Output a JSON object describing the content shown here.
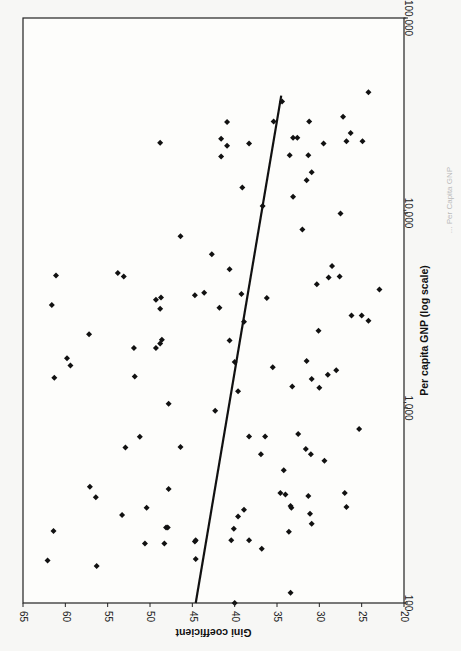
{
  "chart_data": {
    "type": "scatter",
    "orientation": "rotated-90-clockwise",
    "title": "",
    "xlabel": "Per capita GNP  (log scale)",
    "ylabel": "Gini coefficient",
    "x_scale": "log",
    "xlim": [
      100,
      100000
    ],
    "ylim": [
      20,
      65
    ],
    "x_ticks": [
      "100",
      "1,000",
      "10,000",
      "100,000"
    ],
    "y_ticks": [
      "65",
      "60",
      "55",
      "50",
      "45",
      "40",
      "35",
      "30",
      "25",
      "20"
    ],
    "grid": false,
    "legend": null,
    "trendline": {
      "x": [
        100,
        40000
      ],
      "y": [
        44.6,
        34.5
      ]
    },
    "caption": "... Per Capita GNP",
    "points": [
      {
        "x": 100,
        "y": 40.0
      },
      {
        "x": 113,
        "y": 33.4
      },
      {
        "x": 155,
        "y": 56.3
      },
      {
        "x": 165,
        "y": 62.1
      },
      {
        "x": 168,
        "y": 44.6
      },
      {
        "x": 202,
        "y": 50.6
      },
      {
        "x": 202,
        "y": 48.3
      },
      {
        "x": 207,
        "y": 44.7
      },
      {
        "x": 210,
        "y": 44.6
      },
      {
        "x": 210,
        "y": 40.4
      },
      {
        "x": 210,
        "y": 38.3
      },
      {
        "x": 190,
        "y": 36.8
      },
      {
        "x": 234,
        "y": 61.4
      },
      {
        "x": 232,
        "y": 33.6
      },
      {
        "x": 244,
        "y": 48.1
      },
      {
        "x": 244,
        "y": 47.9
      },
      {
        "x": 240,
        "y": 40.1
      },
      {
        "x": 255,
        "y": 30.9
      },
      {
        "x": 283,
        "y": 53.3
      },
      {
        "x": 287,
        "y": 31.1
      },
      {
        "x": 278,
        "y": 39.6
      },
      {
        "x": 308,
        "y": 50.4
      },
      {
        "x": 301,
        "y": 38.9
      },
      {
        "x": 308,
        "y": 33.3
      },
      {
        "x": 314,
        "y": 33.4
      },
      {
        "x": 311,
        "y": 26.8
      },
      {
        "x": 349,
        "y": 56.4
      },
      {
        "x": 360,
        "y": 34.0
      },
      {
        "x": 367,
        "y": 34.6
      },
      {
        "x": 354,
        "y": 31.3
      },
      {
        "x": 395,
        "y": 57.1
      },
      {
        "x": 384,
        "y": 47.8
      },
      {
        "x": 366,
        "y": 27.0
      },
      {
        "x": 480,
        "y": 34.2
      },
      {
        "x": 537,
        "y": 29.4
      },
      {
        "x": 579,
        "y": 36.9
      },
      {
        "x": 579,
        "y": 31.0
      },
      {
        "x": 617,
        "y": 31.6
      },
      {
        "x": 628,
        "y": 52.9
      },
      {
        "x": 631,
        "y": 46.4
      },
      {
        "x": 712,
        "y": 51.2
      },
      {
        "x": 714,
        "y": 38.3
      },
      {
        "x": 714,
        "y": 36.4
      },
      {
        "x": 735,
        "y": 32.5
      },
      {
        "x": 781,
        "y": 25.3
      },
      {
        "x": 969,
        "y": 42.3
      },
      {
        "x": 1052,
        "y": 47.8
      },
      {
        "x": 1220,
        "y": 39.6
      },
      {
        "x": 1290,
        "y": 33.2
      },
      {
        "x": 1270,
        "y": 30.0
      },
      {
        "x": 1430,
        "y": 61.3
      },
      {
        "x": 1450,
        "y": 51.8
      },
      {
        "x": 1410,
        "y": 30.9
      },
      {
        "x": 1480,
        "y": 29.0
      },
      {
        "x": 1560,
        "y": 28.0
      },
      {
        "x": 1650,
        "y": 59.4
      },
      {
        "x": 1620,
        "y": 35.5
      },
      {
        "x": 1800,
        "y": 59.8
      },
      {
        "x": 1720,
        "y": 40.0
      },
      {
        "x": 1740,
        "y": 31.5
      },
      {
        "x": 2030,
        "y": 51.9
      },
      {
        "x": 2030,
        "y": 49.3
      },
      {
        "x": 2140,
        "y": 48.8
      },
      {
        "x": 2240,
        "y": 48.6
      },
      {
        "x": 2220,
        "y": 40.6
      },
      {
        "x": 2390,
        "y": 57.2
      },
      {
        "x": 2490,
        "y": 30.1
      },
      {
        "x": 2770,
        "y": 38.9
      },
      {
        "x": 2800,
        "y": 24.2
      },
      {
        "x": 2980,
        "y": 26.2
      },
      {
        "x": 2980,
        "y": 25.0
      },
      {
        "x": 3370,
        "y": 61.6
      },
      {
        "x": 3230,
        "y": 48.8
      },
      {
        "x": 3270,
        "y": 41.8
      },
      {
        "x": 3590,
        "y": 49.3
      },
      {
        "x": 3690,
        "y": 48.7
      },
      {
        "x": 3660,
        "y": 36.2
      },
      {
        "x": 3790,
        "y": 44.7
      },
      {
        "x": 3900,
        "y": 43.6
      },
      {
        "x": 3840,
        "y": 39.2
      },
      {
        "x": 4050,
        "y": 22.9
      },
      {
        "x": 4310,
        "y": 30.3
      },
      {
        "x": 4780,
        "y": 61.1
      },
      {
        "x": 4720,
        "y": 53.1
      },
      {
        "x": 4920,
        "y": 53.8
      },
      {
        "x": 4670,
        "y": 28.9
      },
      {
        "x": 4720,
        "y": 27.6
      },
      {
        "x": 5140,
        "y": 40.6
      },
      {
        "x": 5350,
        "y": 28.5
      },
      {
        "x": 6150,
        "y": 42.7
      },
      {
        "x": 7610,
        "y": 46.4
      },
      {
        "x": 8240,
        "y": 32.0
      },
      {
        "x": 9950,
        "y": 27.5
      },
      {
        "x": 10850,
        "y": 36.7
      },
      {
        "x": 12100,
        "y": 33.1
      },
      {
        "x": 13500,
        "y": 39.1
      },
      {
        "x": 14700,
        "y": 31.5
      },
      {
        "x": 16200,
        "y": 30.9
      },
      {
        "x": 19500,
        "y": 41.6
      },
      {
        "x": 19800,
        "y": 33.5
      },
      {
        "x": 19800,
        "y": 31.3
      },
      {
        "x": 22100,
        "y": 40.9
      },
      {
        "x": 22900,
        "y": 48.8
      },
      {
        "x": 22700,
        "y": 38.3
      },
      {
        "x": 22700,
        "y": 29.5
      },
      {
        "x": 23300,
        "y": 26.8
      },
      {
        "x": 23300,
        "y": 24.9
      },
      {
        "x": 24000,
        "y": 41.6
      },
      {
        "x": 24300,
        "y": 33.1
      },
      {
        "x": 24300,
        "y": 32.6
      },
      {
        "x": 25700,
        "y": 26.3
      },
      {
        "x": 29300,
        "y": 40.9
      },
      {
        "x": 29500,
        "y": 35.4
      },
      {
        "x": 29500,
        "y": 31.2
      },
      {
        "x": 31200,
        "y": 27.2
      },
      {
        "x": 37300,
        "y": 34.4
      },
      {
        "x": 41600,
        "y": 24.2
      }
    ]
  }
}
